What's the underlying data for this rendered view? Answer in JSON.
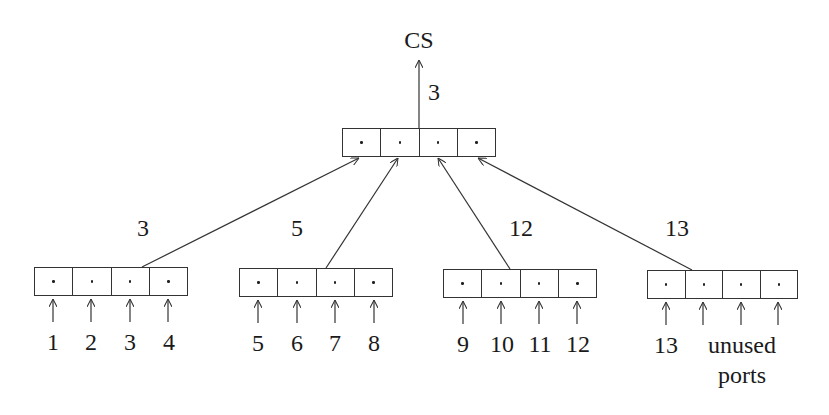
{
  "diagram": {
    "root_label": "CS",
    "root_edge_label": "3",
    "top_node": {
      "cells": 4
    },
    "edge_labels": [
      "3",
      "5",
      "12",
      "13"
    ],
    "leaf_nodes": [
      {
        "inputs": [
          "1",
          "2",
          "3",
          "4"
        ]
      },
      {
        "inputs": [
          "5",
          "6",
          "7",
          "8"
        ]
      },
      {
        "inputs": [
          "9",
          "10",
          "11",
          "12"
        ]
      },
      {
        "inputs": [
          "13"
        ],
        "note": "unused ports"
      }
    ],
    "unused_label_line1": "unused",
    "unused_label_line2": "ports"
  }
}
